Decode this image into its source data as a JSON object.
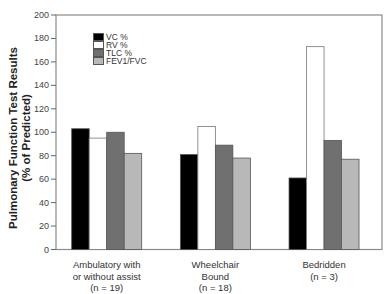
{
  "chart_data": {
    "type": "bar",
    "title": "",
    "xlabel": "",
    "ylabel": "Pulmonary Function Test Results (% of Predicted)",
    "ylabel_lines": [
      "Pulmonary Function Test Results",
      "(% of Predicted)"
    ],
    "ylim": [
      0,
      200
    ],
    "yticks": [
      0,
      20,
      40,
      60,
      80,
      100,
      120,
      140,
      160,
      180,
      200
    ],
    "grid": false,
    "legend_position": "upper-left-inside",
    "categories": [
      "Ambulatory with or without assist (n = 19)",
      "Wheelchair Bound (n = 18)",
      "Bedridden (n = 3)"
    ],
    "category_lines": [
      [
        "Ambulatory with",
        "or without assist",
        "(n = 19)"
      ],
      [
        "Wheelchair",
        "Bound",
        "(n = 18)"
      ],
      [
        "Bedridden",
        "(n = 3)"
      ]
    ],
    "series": [
      {
        "name": "VC %",
        "color": "#000000",
        "values": [
          103,
          81,
          61
        ]
      },
      {
        "name": "RV %",
        "color": "#ffffff",
        "values": [
          95,
          105,
          173
        ]
      },
      {
        "name": "TLC %",
        "color": "#707070",
        "values": [
          100,
          89,
          93
        ]
      },
      {
        "name": "FEV1/FVC",
        "color": "#b8b8b8",
        "values": [
          82,
          78,
          77
        ]
      }
    ]
  },
  "legend": {
    "items": [
      {
        "label": "VC %",
        "color": "#000000"
      },
      {
        "label": "RV %",
        "color": "#ffffff"
      },
      {
        "label": "TLC %",
        "color": "#707070"
      },
      {
        "label": "FEV1/FVC",
        "color": "#b8b8b8"
      }
    ]
  },
  "axis": {
    "ytitle_line1": "Pulmonary Function Test Results",
    "ytitle_line2": "(% of Predicted)"
  }
}
